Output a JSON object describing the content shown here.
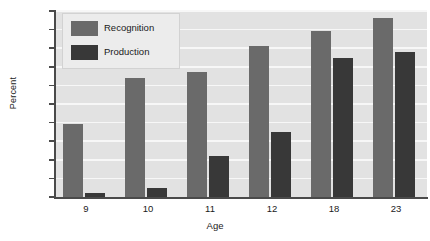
{
  "chart_data": {
    "type": "bar",
    "title": "",
    "xlabel": "Age",
    "ylabel": "Percent",
    "categories": [
      "9",
      "10",
      "11",
      "12",
      "18",
      "23"
    ],
    "series": [
      {
        "name": "Recognition",
        "color": "#6a6a6a",
        "values": [
          39,
          64,
          67,
          81,
          89,
          96
        ]
      },
      {
        "name": "Production",
        "color": "#383838",
        "values": [
          2,
          5,
          22,
          35,
          75,
          78
        ]
      }
    ],
    "ylim": [
      0,
      100
    ],
    "yticks": [
      0,
      10,
      20,
      30,
      40,
      50,
      60,
      70,
      80,
      90,
      100
    ],
    "ytick_labels": [
      "0",
      "10",
      "20",
      "30",
      "40",
      "50",
      "60",
      "70",
      "80",
      "90",
      "100"
    ],
    "grid": true,
    "grid_axis": "y",
    "grid_color": "#f7f7f7",
    "plot_background": "#e2e2e2",
    "legend_position": "upper-left",
    "legend_entries": [
      "Recognition",
      "Production"
    ]
  }
}
